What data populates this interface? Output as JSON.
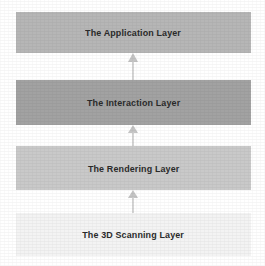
{
  "diagram": {
    "background_color": "#ffffff",
    "text_color": "#2b2b2b",
    "arrow_color": "#c4c4c4",
    "layers": [
      {
        "id": "application",
        "label": "The Application Layer",
        "fill": "#b6b6b6",
        "level": 4
      },
      {
        "id": "interaction",
        "label": "The Interaction Layer",
        "fill": "#a2a2a2",
        "level": 3
      },
      {
        "id": "rendering",
        "label": "The Rendering Layer",
        "fill": "#c9c9c9",
        "level": 2
      },
      {
        "id": "scanning",
        "label": "The 3D Scanning Layer",
        "fill": "#f3f3f3",
        "level": 1
      }
    ],
    "arrows": [
      {
        "id": "interaction-to-application",
        "direction": "up",
        "from": "interaction",
        "to": "application"
      },
      {
        "id": "rendering-to-interaction",
        "direction": "up",
        "from": "rendering",
        "to": "interaction"
      },
      {
        "id": "scanning-to-rendering",
        "direction": "up",
        "from": "scanning",
        "to": "rendering"
      }
    ]
  }
}
